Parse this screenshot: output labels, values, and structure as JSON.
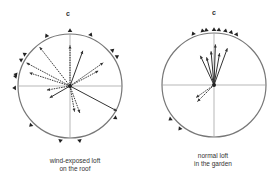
{
  "diagrams": [
    {
      "id": "left",
      "top_label": "c",
      "caption_line1": "wind-exposed loft",
      "caption_line2": "on the roof",
      "center": [
        70,
        86
      ],
      "radius": 52,
      "vectors": [
        {
          "angle": 0,
          "len": 0.78,
          "dashed": true
        },
        {
          "angle": 20,
          "len": 0.72,
          "dashed": false
        },
        {
          "angle": 55,
          "len": 0.78,
          "dashed": true
        },
        {
          "angle": 62,
          "len": 0.62,
          "dashed": true
        },
        {
          "angle": -38,
          "len": 0.95,
          "dashed": true
        },
        {
          "angle": -62,
          "len": 0.95,
          "dashed": true
        },
        {
          "angle": -72,
          "len": 0.82,
          "dashed": true
        },
        {
          "angle": -100,
          "len": 0.45,
          "dashed": true
        },
        {
          "angle": -120,
          "len": 0.45,
          "dashed": false
        },
        {
          "angle": 118,
          "len": 1.02,
          "dashed": false
        },
        {
          "angle": 160,
          "len": 0.55,
          "dashed": true
        },
        {
          "angle": 170,
          "len": 0.5,
          "dashed": true
        }
      ],
      "markers": [
        0,
        22,
        50,
        58,
        125,
        170,
        190,
        -25,
        -55,
        -62,
        -78,
        -80,
        -92,
        -135
      ]
    },
    {
      "id": "right",
      "top_label": "c",
      "caption_line1": "normal loft",
      "caption_line2": "in the garden",
      "center": [
        214,
        85
      ],
      "radius": 52,
      "vectors": [
        {
          "angle": -5,
          "len": 0.65,
          "dashed": false
        },
        {
          "angle": -15,
          "len": 0.55,
          "dashed": false
        },
        {
          "angle": -25,
          "len": 0.62,
          "dashed": false
        },
        {
          "angle": 2,
          "len": 0.78,
          "dashed": false
        },
        {
          "angle": 10,
          "len": 0.62,
          "dashed": false
        },
        {
          "angle": 20,
          "len": 0.75,
          "dashed": false
        },
        {
          "angle": -125,
          "len": 0.42,
          "dashed": true
        },
        {
          "angle": -135,
          "len": 0.45,
          "dashed": true
        }
      ],
      "markers": [
        0,
        5,
        12,
        18,
        24,
        -8,
        -12,
        -22,
        -128,
        -142
      ]
    }
  ]
}
